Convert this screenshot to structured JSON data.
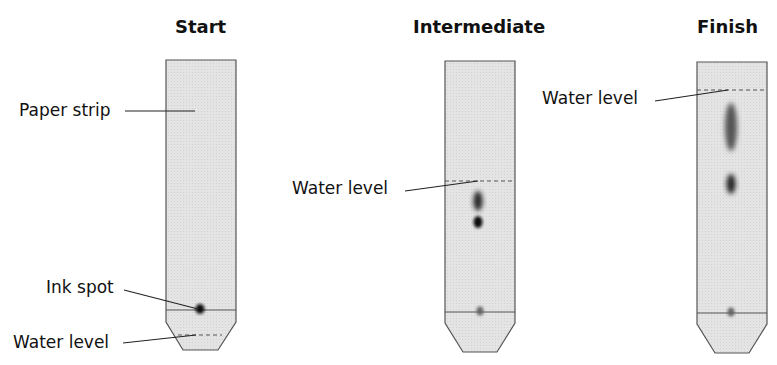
{
  "diagram": {
    "type": "paper chromatography stages",
    "stages": [
      {
        "title": "Start",
        "labels": [
          "Paper strip",
          "Ink spot",
          "Water level"
        ]
      },
      {
        "title": "Intermediate",
        "labels": [
          "Water level"
        ]
      },
      {
        "title": "Finish",
        "labels": [
          "Water level"
        ]
      }
    ]
  },
  "titles": {
    "start": "Start",
    "intermediate": "Intermediate",
    "finish": "Finish"
  },
  "labels": {
    "paper_strip": "Paper strip",
    "ink_spot": "Ink spot",
    "water_level_start": "Water level",
    "water_level_intermediate": "Water level",
    "water_level_finish": "Water level"
  },
  "colors": {
    "strip_fill": "#e6e6e6",
    "strip_stroke": "#555555",
    "ink": "#1a1a1a"
  }
}
